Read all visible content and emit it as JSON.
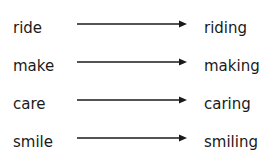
{
  "pairs": [
    {
      "base": "ride",
      "result": "riding"
    },
    {
      "base": "make",
      "result": "making"
    },
    {
      "base": "care",
      "result": "caring"
    },
    {
      "base": "smile",
      "result": "smiling"
    }
  ],
  "colors": {
    "text": "#1a1a1a",
    "arrow": "#1a1a1a"
  }
}
